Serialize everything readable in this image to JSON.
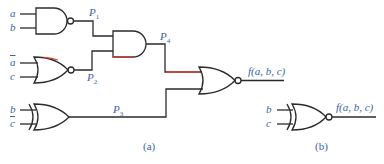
{
  "diagram": {
    "type": "logic circuit",
    "colors": {
      "wire": "#2b2b2b",
      "highlight": "#d9423a",
      "label": "#3a63a8"
    },
    "part_a": {
      "caption": "(a)",
      "gates": [
        {
          "id": "g1",
          "type": "NAND",
          "inputs": [
            "a",
            "b"
          ],
          "output": "P1"
        },
        {
          "id": "g2",
          "type": "NOR",
          "inputs": [
            "ā",
            "c"
          ],
          "output": "P2"
        },
        {
          "id": "g3",
          "type": "AND",
          "inputs": [
            "P1",
            "P2"
          ],
          "output": "P4"
        },
        {
          "id": "g4",
          "type": "XOR",
          "inputs": [
            "b",
            "c̄"
          ],
          "output": "P3"
        },
        {
          "id": "g5",
          "type": "NOR",
          "inputs": [
            "P4",
            "P3"
          ],
          "output": "f(a, b, c)"
        }
      ],
      "labels": {
        "a": "a",
        "b": "b",
        "abar": "a",
        "c": "c",
        "b2": "b",
        "cbar": "c",
        "p": "P",
        "p1": "1",
        "p2": "2",
        "p3": "3",
        "p4": "4",
        "f": "f(a, b, c)"
      }
    },
    "part_b": {
      "caption": "(b)",
      "gates": [
        {
          "id": "g6",
          "type": "XNOR",
          "inputs": [
            "b",
            "c"
          ],
          "output": "f(a, b, c)"
        }
      ],
      "labels": {
        "b": "b",
        "c": "c",
        "f": "f(a, b, c)"
      }
    }
  }
}
